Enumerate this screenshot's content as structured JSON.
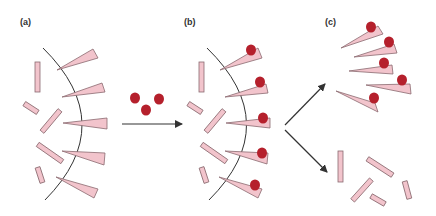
{
  "panels": [
    {
      "id": "a",
      "label": "(a)",
      "label_pos": [
        20,
        17
      ]
    },
    {
      "id": "b",
      "label": "(b)",
      "label_pos": [
        184,
        17
      ]
    },
    {
      "id": "c",
      "label": "(c)",
      "label_pos": [
        325,
        17
      ]
    }
  ],
  "colors": {
    "rod_fill": "#f2c4cc",
    "rod_stroke": "#8a6a70",
    "dot_fill": "#b5202c",
    "arc_stroke": "#333333",
    "arrow": "#333333"
  }
}
